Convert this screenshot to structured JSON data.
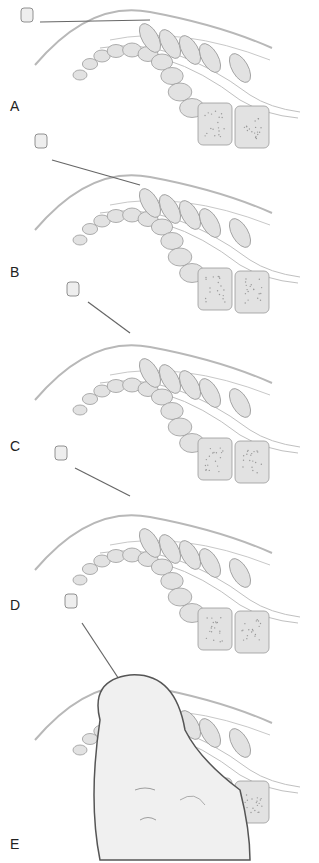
{
  "figure": {
    "panels": [
      {
        "label": "A",
        "top": 0,
        "label_y": 98,
        "needle": {
          "x1": 40,
          "y1": 22,
          "x2": 150,
          "y2": 20,
          "hub_x": 28,
          "hub_y": 14
        }
      },
      {
        "label": "B",
        "top": 165,
        "label_y": 264,
        "needle": {
          "x1": 52,
          "y1": 160,
          "x2": 140,
          "y2": 185,
          "hub_x": 42,
          "hub_y": 140
        }
      },
      {
        "label": "C",
        "top": 335,
        "label_y": 438,
        "needle": {
          "x1": 88,
          "y1": 302,
          "x2": 130,
          "y2": 333,
          "hub_x": 74,
          "hub_y": 288
        }
      },
      {
        "label": "D",
        "top": 505,
        "label_y": 597,
        "needle": {
          "x1": 75,
          "y1": 468,
          "x2": 130,
          "y2": 496,
          "hub_x": 62,
          "hub_y": 452
        }
      },
      {
        "label": "E",
        "top": 675,
        "label_y": 836,
        "needle": {
          "x1": 82,
          "y1": 623,
          "x2": 138,
          "y2": 708,
          "hub_x": 72,
          "hub_y": 600
        }
      }
    ],
    "colors": {
      "bone_fill": "#e2e2e2",
      "bone_stroke": "#9a9a9a",
      "skin_line": "#b8b8b8",
      "needle": "#666666",
      "fetus_fill": "#f0f0f0",
      "uterus_line": "#555555"
    }
  }
}
